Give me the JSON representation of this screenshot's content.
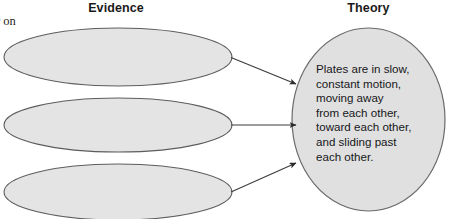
{
  "figure": {
    "background_color": "#ffffff",
    "columns": {
      "evidence_heading": "Evidence",
      "theory_heading": "Theory"
    },
    "margin_text_fragment": "r on",
    "evidence_shapes": [
      {
        "label": "",
        "shape": "ellipse"
      },
      {
        "label": "",
        "shape": "ellipse"
      },
      {
        "label": "",
        "shape": "ellipse"
      }
    ],
    "theory_shape": {
      "shape": "circle",
      "text": "Plates are in slow,\nconstant motion,\nmoving away\nfrom each other,\ntoward each other,\nand sliding past\neach other."
    },
    "connectors": [
      {
        "from": "evidence-ellipse-1",
        "to": "theory-circle",
        "style": "arrow"
      },
      {
        "from": "evidence-ellipse-2",
        "to": "theory-circle",
        "style": "arrow"
      },
      {
        "from": "evidence-ellipse-3",
        "to": "theory-circle",
        "style": "arrow"
      }
    ],
    "colors": {
      "shape_fill": "#e4e4e4",
      "shape_stroke": "#5d5d5d",
      "circle_fill": "#e0e0e0",
      "circle_stroke": "#6a6a6a",
      "connector": "#3a3a3a",
      "heading_text": "#1a1a1a",
      "body_text": "#17171a"
    }
  }
}
